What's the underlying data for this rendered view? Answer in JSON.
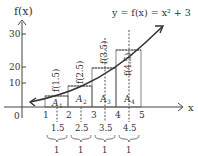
{
  "diagram": {
    "y_axis_label": "f(x)",
    "x_axis_label": "x",
    "equation": "y = f(x) = x² + 3",
    "origin_label": "0",
    "y_ticks": [
      "10",
      "20",
      "30"
    ],
    "x_ticks": [
      "1",
      "2",
      "3",
      "4",
      "5"
    ],
    "area_labels": [
      "A",
      "A",
      "A",
      "A"
    ],
    "area_subs": [
      "1",
      "2",
      "3",
      "4"
    ],
    "height_labels": [
      "f(1.5)",
      "f(2.5)",
      "f(3.5)",
      "f(4.5)"
    ],
    "midpoints": [
      "1.5",
      "2.5",
      "3.5",
      "4.5"
    ],
    "widths": [
      "1",
      "1",
      "1",
      "1"
    ]
  }
}
